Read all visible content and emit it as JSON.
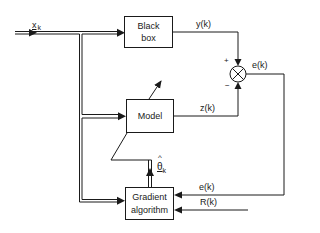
{
  "diagram": {
    "type": "adaptive system identification block diagram",
    "blocks": {
      "black_box": {
        "line1": "Black",
        "line2": "box"
      },
      "model": {
        "label": "Model"
      },
      "gradient": {
        "line1": "Gradient",
        "line2": "algorithm"
      }
    },
    "signals": {
      "input": {
        "symbol": "x",
        "subscript": "k"
      },
      "plant_output": "y(k)",
      "model_output": "z(k)",
      "error_summer": "e(k)",
      "error_feedback": "e(k)",
      "reference": "R(k)",
      "parameter_estimate": {
        "hat": "^",
        "symbol": "θ",
        "subscript": "k"
      }
    },
    "summer": {
      "plus_sign": "+",
      "minus_sign": "−",
      "symbol": "×"
    },
    "colors": {
      "line": "#1a1a1a",
      "background": "#ffffff"
    }
  }
}
